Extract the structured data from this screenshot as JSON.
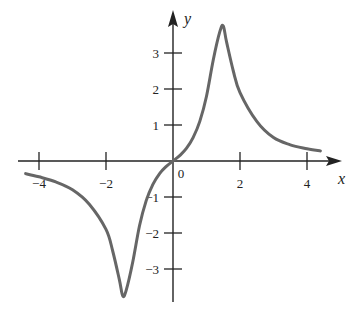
{
  "chart_data": {
    "type": "line",
    "title": "",
    "xlabel": "x",
    "ylabel": "y",
    "xlim": [
      -4.5,
      4.5
    ],
    "ylim": [
      -3.8,
      3.8
    ],
    "grid": false,
    "legend": null,
    "x_ticks": [
      -4,
      -2,
      0,
      2,
      4
    ],
    "x_tick_labels": [
      "−4",
      "−2",
      "0",
      "2",
      "4"
    ],
    "y_ticks": [
      -3,
      -2,
      -1,
      1,
      2,
      3
    ],
    "y_tick_labels": [
      "−3",
      "−2",
      "−1",
      "1",
      "2",
      "3"
    ],
    "series": [
      {
        "name": "f(x)",
        "color": "#666666",
        "x": [
          -4.4,
          -4.0,
          -3.5,
          -3.0,
          -2.5,
          -2.0,
          -1.8,
          -1.6,
          -1.5,
          -1.4,
          -1.2,
          -1.0,
          -0.8,
          -0.6,
          -0.4,
          -0.2,
          0.0,
          0.2,
          0.4,
          0.6,
          0.8,
          1.0,
          1.2,
          1.4,
          1.5,
          1.6,
          1.8,
          2.0,
          2.5,
          3.0,
          3.5,
          4.0,
          4.4
        ],
        "y": [
          -0.35,
          -0.44,
          -0.58,
          -0.8,
          -1.2,
          -1.9,
          -2.5,
          -3.3,
          -3.75,
          -3.6,
          -2.8,
          -1.8,
          -1.1,
          -0.65,
          -0.35,
          -0.15,
          0.0,
          0.15,
          0.35,
          0.65,
          1.1,
          1.8,
          2.8,
          3.6,
          3.75,
          3.3,
          2.5,
          1.9,
          1.1,
          0.65,
          0.45,
          0.34,
          0.28
        ]
      }
    ]
  }
}
